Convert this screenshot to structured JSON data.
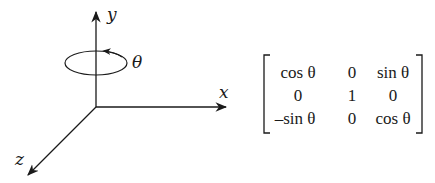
{
  "diagram": {
    "axes": {
      "x_label": "x",
      "y_label": "y",
      "z_label": "z",
      "rotation_label": "θ"
    },
    "matrix": {
      "rows": [
        [
          "cos θ",
          "0",
          "sin θ"
        ],
        [
          "0",
          "1",
          "0"
        ],
        [
          "–sin θ",
          "0",
          "cos θ"
        ]
      ]
    }
  }
}
